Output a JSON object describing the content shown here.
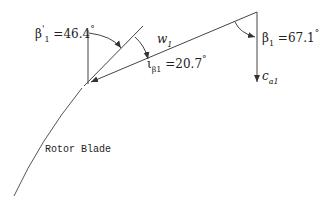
{
  "diagram": {
    "labels": {
      "beta1_prime": {
        "symbol": "β",
        "prime": "'",
        "subscript": "1",
        "value": "=46.4",
        "unit": "°"
      },
      "beta1": {
        "symbol": "β",
        "subscript": "1",
        "value": "=67.1",
        "unit": "°"
      },
      "incidence": {
        "symbol": "ι",
        "subscript": "β1",
        "value": "=20.7",
        "unit": "°"
      },
      "w1": {
        "symbol": "w",
        "subscript": "1"
      },
      "ca1": {
        "symbol": "c",
        "subscript": "a1"
      },
      "rotor_blade": "Rotor Blade"
    },
    "colors": {
      "line": "#333333",
      "text": "#222222",
      "background": "#ffffff"
    }
  }
}
